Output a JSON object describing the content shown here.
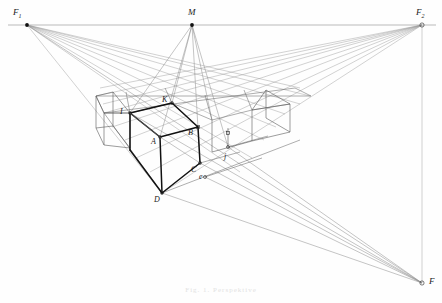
{
  "figure": {
    "type": "technical-line-drawing",
    "canvas": {
      "width": 442,
      "height": 303
    },
    "background_color": "#fefefe",
    "line_color_construction": "#8a8a8a",
    "line_color_grid": "#555555",
    "line_color_solid": "#111111",
    "label_color": "#1a1a1a"
  },
  "horizon": {
    "label": "horizon-line",
    "y": 25,
    "x_start": 8,
    "x_end": 436,
    "color": "#999999"
  },
  "vanishing_points": [
    {
      "id": "F1",
      "label": "F",
      "sub": "1",
      "x": 27,
      "y": 25,
      "role": "left-vanishing-point"
    },
    {
      "id": "F2",
      "label": "F",
      "sub": "2",
      "x": 422,
      "y": 25,
      "role": "right-vanishing-point"
    },
    {
      "id": "M",
      "label": "M",
      "sub": "",
      "x": 192,
      "y": 25,
      "role": "measuring-point"
    },
    {
      "id": "F",
      "label": "F",
      "sub": "",
      "x": 422,
      "y": 283,
      "role": "vertical-vanishing-point"
    }
  ],
  "cube_points": [
    {
      "id": "I",
      "label": "I",
      "x": 130,
      "y": 113,
      "label_dx": -10,
      "label_dy": -2
    },
    {
      "id": "K",
      "label": "K",
      "x": 172,
      "y": 103,
      "label_dx": -10,
      "label_dy": -2
    },
    {
      "id": "A",
      "label": "A",
      "x": 160,
      "y": 137,
      "label_dx": -9,
      "label_dy": 7
    },
    {
      "id": "B",
      "label": "B",
      "x": 198,
      "y": 127,
      "label_dx": -10,
      "label_dy": 7
    },
    {
      "id": "C",
      "label": "C",
      "x": 200,
      "y": 163,
      "label_dx": -9,
      "label_dy": 8
    },
    {
      "id": "D",
      "label": "D",
      "x": 162,
      "y": 193,
      "label_dx": -8,
      "label_dy": 10
    },
    {
      "id": "j",
      "label": "j",
      "x": 228,
      "y": 147,
      "label_dx": -5,
      "label_dy": 11
    },
    {
      "id": "e",
      "label": "e",
      "x": 205,
      "y": 177,
      "label_dx": -6,
      "label_dy": 2
    }
  ],
  "caption": {
    "text": "Fig. 1.  Perspektive",
    "visible": false
  },
  "legend": {
    "construction_lines": "thin grey rays to vanishing points",
    "grid_lines": "medium grey perspective grid of unit squares",
    "solid_lines": "heavy black edges of the unit cube"
  }
}
